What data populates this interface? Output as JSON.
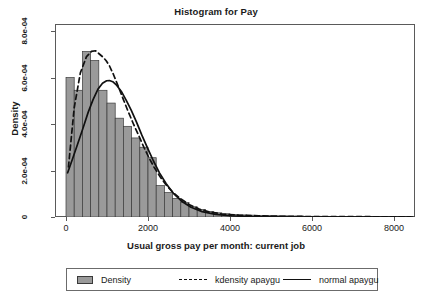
{
  "chart_data": {
    "type": "bar",
    "title": "Histogram for Pay",
    "xlabel": "Usual gross pay per month: current job",
    "ylabel": "Density",
    "xlim": [
      0,
      8520
    ],
    "ylim": [
      0,
      0.00086
    ],
    "grid": false,
    "legend_position": "below-axes",
    "xticks": [
      0,
      2000,
      4000,
      6000,
      8000
    ],
    "xtick_labels": [
      "0",
      "2000",
      "4000",
      "6000",
      "8000"
    ],
    "yticks": [
      0,
      0.0002,
      0.0004,
      0.0006,
      0.0008
    ],
    "ytick_labels": [
      "0",
      "2.0e-04",
      "4.0e-04",
      "6.0e-04",
      "8.0e-04"
    ],
    "bin_width": 200,
    "bin_starts": [
      0,
      200,
      400,
      600,
      800,
      1000,
      1200,
      1400,
      1600,
      1800,
      2000,
      2200,
      2400,
      2600,
      2800,
      3000,
      3200,
      3400,
      3600,
      3800,
      4000,
      4200,
      4400,
      4600,
      4800,
      5000,
      5200,
      5400,
      5600,
      5800,
      6000,
      6200,
      6400,
      6600,
      6800,
      7000,
      7200,
      7400,
      7600,
      7800,
      8000,
      8200,
      8400
    ],
    "categories": [
      "0-200",
      "200-400",
      "400-600",
      "600-800",
      "800-1000",
      "1000-1200",
      "1200-1400",
      "1400-1600",
      "1600-1800",
      "1800-2000",
      "2000-2200",
      "2200-2400",
      "2400-2600",
      "2600-2800",
      "2800-3000",
      "3000-3200",
      "3200-3400",
      "3400-3600",
      "3600-3800",
      "3800-4000",
      "4000-4200",
      "4200-4400",
      "4400-4600",
      "4600-4800",
      "4800-5000",
      "5000-5200",
      "5200-5400",
      "5400-5600",
      "5600-5800",
      "5800-6000",
      "6000-6200",
      "6200-6400",
      "6400-6600",
      "6600-6800",
      "6800-7000",
      "7000-7200",
      "7200-7400",
      "7400-7600",
      "7600-7800",
      "7800-8000",
      "8000-8200",
      "8200-8400",
      "8400-8520"
    ],
    "values": [
      0.0006,
      0.000545,
      0.000712,
      0.000673,
      0.000545,
      0.00049,
      0.000425,
      0.00039,
      0.00034,
      0.0003,
      0.000255,
      0.000135,
      0.000105,
      8e-05,
      6.2e-05,
      4.4e-05,
      3.2e-05,
      2.4e-05,
      1.8e-05,
      1.4e-05,
      1.1e-05,
      9e-06,
      8e-06,
      7e-06,
      6e-06,
      5e-06,
      5e-06,
      4e-06,
      4e-06,
      3e-06,
      3e-06,
      3e-06,
      2e-06,
      2e-06,
      2e-06,
      2e-06,
      2e-06,
      2e-06,
      1e-06,
      1e-06,
      1e-06,
      1e-06,
      1e-06
    ],
    "series": [
      {
        "name": "kdensity apaygu",
        "style": "dashed",
        "x": [
          60,
          200,
          350,
          500,
          620,
          720,
          820,
          900,
          980,
          1060,
          1160,
          1280,
          1400,
          1520,
          1650,
          1780,
          1900,
          2020,
          2150,
          2300,
          2450,
          2620,
          2800,
          3000,
          3250,
          3500,
          3800,
          4200,
          4700,
          5300,
          6000,
          6800,
          7600,
          8400
        ],
        "y": [
          0.000215,
          0.00047,
          0.00062,
          0.00069,
          0.000712,
          0.000715,
          0.0007,
          0.000688,
          0.000672,
          0.00065,
          0.000612,
          0.00056,
          0.000505,
          0.000452,
          0.000398,
          0.000348,
          0.0003,
          0.000256,
          0.000214,
          0.000172,
          0.000136,
          0.000104,
          7.8e-05,
          5.4e-05,
          3.4e-05,
          2.2e-05,
          1.3e-05,
          8e-06,
          5e-06,
          3e-06,
          2e-06,
          2e-06,
          1e-06,
          1e-06
        ]
      },
      {
        "name": "normal apaygu",
        "style": "solid",
        "mean": 1060,
        "sd": 690,
        "peak": 0.000587,
        "x": [
          40,
          150,
          280,
          410,
          540,
          660,
          780,
          890,
          990,
          1060,
          1140,
          1240,
          1350,
          1470,
          1590,
          1720,
          1850,
          1990,
          2130,
          2280,
          2440,
          2620,
          2820,
          3050,
          3320,
          3650,
          4050,
          4550,
          5200,
          6000,
          6900,
          7800,
          8450
        ],
        "y": [
          0.00019,
          0.000245,
          0.000312,
          0.00038,
          0.00045,
          0.000505,
          0.00055,
          0.000575,
          0.000586,
          0.000587,
          0.000582,
          0.000566,
          0.00054,
          0.000502,
          0.00046,
          0.000408,
          0.000352,
          0.000296,
          0.000242,
          0.00019,
          0.000144,
          0.000102,
          6.8e-05,
          4.2e-05,
          2.3e-05,
          1.1e-05,
          5e-06,
          2e-06,
          1e-06,
          0.0,
          0.0,
          0.0,
          0.0
        ]
      }
    ],
    "legend": [
      {
        "label": "Density",
        "marker": "swatch",
        "color": "#9a9a9a"
      },
      {
        "label": "kdensity apaygu",
        "marker": "dashed-line",
        "color": "#111111"
      },
      {
        "label": "normal apaygu",
        "marker": "solid-line",
        "color": "#111111"
      }
    ],
    "colors": {
      "bar_fill": "#9a9a9a",
      "bar_edge": "#3a3a3a",
      "curve": "#111111",
      "frame": "#5a5a5a",
      "background": "#ffffff"
    }
  }
}
